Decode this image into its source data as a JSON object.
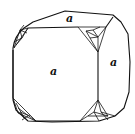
{
  "diagram": {
    "type": "crystal-form",
    "faces": [
      {
        "name": "top",
        "label": "a"
      },
      {
        "name": "front",
        "label": "a"
      },
      {
        "name": "right",
        "label": "a"
      }
    ],
    "colors": {
      "line": "#111111",
      "background": "#ffffff"
    }
  }
}
